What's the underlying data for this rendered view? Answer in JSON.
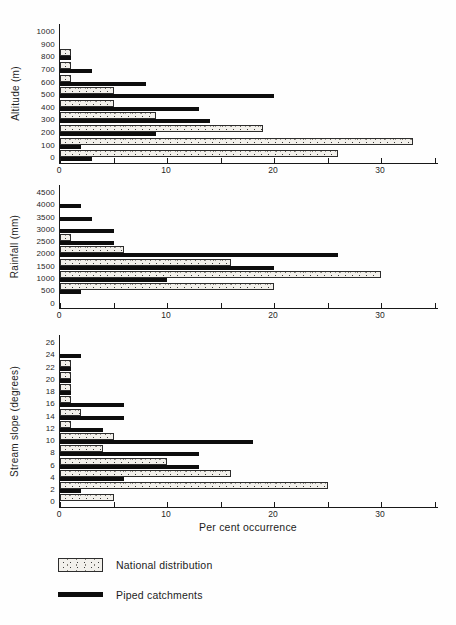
{
  "axis": {
    "tick_values": [
      0,
      5,
      10,
      15,
      20,
      25,
      30,
      35
    ],
    "labeled_ticks": [
      {
        "value": 0,
        "label": "0"
      },
      {
        "value": 10,
        "label": "10"
      },
      {
        "value": 20,
        "label": "20"
      },
      {
        "value": 30,
        "label": "30"
      }
    ],
    "xlabel": "Per cent occurrence"
  },
  "legend": {
    "items": [
      {
        "label": "National distribution",
        "swatch": "stippled"
      },
      {
        "label": "Piped catchments",
        "swatch": "black-line"
      }
    ]
  },
  "colors": {
    "bar_black": "#0d0d0d",
    "stipple_background": "#f2f0eb",
    "stipple_dot": "#3c3830",
    "axis": "#181818"
  },
  "chart_data": [
    {
      "type": "bar",
      "orientation": "horizontal",
      "ylabel": "Altitude (m)",
      "categories": [
        "1000",
        "900",
        "800",
        "700",
        "600",
        "500",
        "400",
        "300",
        "200",
        "100",
        "0"
      ],
      "series": [
        {
          "name": "National distribution",
          "values": [
            0,
            0,
            1,
            1,
            1,
            5,
            5,
            9,
            19,
            33,
            26
          ]
        },
        {
          "name": "Piped catchments",
          "values": [
            0,
            0,
            1,
            3,
            8,
            20,
            13,
            14,
            9,
            2,
            3
          ]
        }
      ],
      "xlim": [
        0,
        35
      ],
      "grid": false,
      "legend_position": "bottom"
    },
    {
      "type": "bar",
      "orientation": "horizontal",
      "ylabel": "Rainfall (mm)",
      "categories": [
        "4500",
        "4000",
        "3500",
        "3000",
        "2500",
        "2000",
        "1500",
        "1000",
        "500",
        "0"
      ],
      "series": [
        {
          "name": "National distribution",
          "values": [
            0,
            0,
            0,
            0,
            1,
            6,
            16,
            30,
            20,
            0
          ]
        },
        {
          "name": "Piped catchments",
          "values": [
            0,
            2,
            3,
            5,
            5,
            26,
            20,
            10,
            2,
            0
          ]
        }
      ],
      "xlim": [
        0,
        35
      ],
      "grid": false,
      "legend_position": "bottom"
    },
    {
      "type": "bar",
      "orientation": "horizontal",
      "ylabel": "Stream slope (degrees)",
      "xlabel": "Per cent occurrence",
      "categories": [
        "26",
        "24",
        "22",
        "20",
        "18",
        "16",
        "14",
        "12",
        "10",
        "8",
        "6",
        "4",
        "2",
        "0"
      ],
      "series": [
        {
          "name": "National distribution",
          "values": [
            0,
            0,
            1,
            1,
            1,
            1,
            2,
            1,
            5,
            4,
            10,
            16,
            25,
            5
          ]
        },
        {
          "name": "Piped catchments",
          "values": [
            0,
            2,
            1,
            1,
            1,
            6,
            6,
            4,
            18,
            13,
            13,
            6,
            2,
            0
          ]
        }
      ],
      "xlim": [
        0,
        35
      ],
      "grid": false,
      "legend_position": "bottom"
    }
  ]
}
